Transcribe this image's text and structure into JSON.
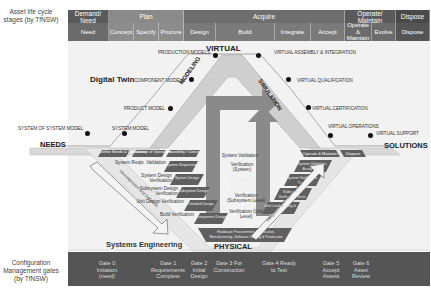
{
  "side_labels": {
    "lifecycle": "Asset life cycle stages (by TfNSW)",
    "gates": "Configuration Management gates (by TfNSW)"
  },
  "stages": [
    {
      "label": "Demand/ Need",
      "color": "#5a5a5a"
    },
    {
      "label": "Plan",
      "color": "#8a8a8a"
    },
    {
      "label": "Acquire",
      "color": "#6e6e6e"
    },
    {
      "label": "Operate/ Maintain",
      "color": "#5a5a5a"
    },
    {
      "label": "Dispose",
      "color": "#4a4a4a"
    }
  ],
  "substages": [
    {
      "label": "Need",
      "color": "#6b6b6b"
    },
    {
      "label": "Concept",
      "color": "#8c8c8c"
    },
    {
      "label": "Specify",
      "color": "#8c8c8c"
    },
    {
      "label": "Procure",
      "color": "#8c8c8c"
    },
    {
      "label": "Design",
      "color": "#7a7a7a"
    },
    {
      "label": "Build",
      "color": "#7a7a7a"
    },
    {
      "label": "Integrate",
      "color": "#7a7a7a"
    },
    {
      "label": "Accept",
      "color": "#7a7a7a"
    },
    {
      "label": "Operate & Maintain",
      "color": "#6b6b6b"
    },
    {
      "label": "Evolve",
      "color": "#6b6b6b"
    },
    {
      "label": "Dispose",
      "color": "#555555"
    }
  ],
  "gates": [
    {
      "label": "Gate 0 Initiation (need)"
    },
    {
      "label": "Gate 1 Requirements Complete"
    },
    {
      "label": "Gate 2 Initial Design"
    },
    {
      "label": "Gate 3 For Construction"
    },
    {
      "label": "Gate 4 Ready to Test"
    },
    {
      "label": "Gate 5 Accept Assets"
    },
    {
      "label": "Gate 6 Asset Review"
    }
  ],
  "digital_twin": {
    "title": "Digital Twin",
    "virtual": "VIRTUAL",
    "modeling": "MODELING",
    "simulation": "SIMULATION",
    "left_nodes": [
      "SYSTEM OF SYSTEM MODEL",
      "SYSTEM MODEL",
      "PRODUCT MODEL",
      "COMPONENT MODELS",
      "PRODUCTION MODELS"
    ],
    "right_nodes": [
      "VIRTUAL ASSEMBLY & INTEGRATION",
      "VIRTUAL QUALIFICATION",
      "VIRTUAL CERTIFICATION",
      "VIRTUAL OPERATIONS",
      "VIRTUAL SUPPORT"
    ]
  },
  "ends": {
    "needs": "NEEDS",
    "solutions": "SOLUTIONS"
  },
  "systems_engineering": {
    "title": "Systems Engineering",
    "physical": "PHYSICAL",
    "decomposition_arrow": "Decomposition and Definition",
    "integration_arrow": "Integration and Recomposition",
    "top_boxes": [
      "Define Needs & Operations",
      "Concept of Operations",
      "Feasibility / Concept",
      "Operate & Maintain",
      "Dispose"
    ],
    "left_steps": [
      "System Reqts. Validation",
      "System Design Verification",
      "Subsystem Design Verification",
      "Unit Design Verification",
      "Build Verification"
    ],
    "left_boxes": [
      "System Requirements",
      "System Design",
      "Subsystem Design",
      "Detailed Design",
      "Component Design"
    ],
    "center_steps": [
      "System Validation",
      "Verification (System)",
      "Verification (Subsystem Interfaces)",
      "Verification (Subsystem Level)",
      "Verification (Unit Level)"
    ],
    "right_boxes": [
      "System Validation Acceptance",
      "System Verification Tests",
      "Subsystem Verification Tests",
      "Unit Level Testing & Test"
    ],
    "bottom_box": "Hardware Procurement, Fabrication, Manufacturing, Software Coding & Production"
  }
}
